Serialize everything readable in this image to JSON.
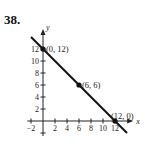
{
  "problem_number": "38.",
  "chart_data": {
    "type": "line",
    "title": "",
    "xlabel": "x",
    "ylabel": "y",
    "x_ticks": [
      -2,
      2,
      4,
      6,
      8,
      10,
      12
    ],
    "y_ticks": [
      2,
      4,
      6,
      8,
      10,
      12
    ],
    "xlim": [
      -2,
      14
    ],
    "ylim": [
      -2,
      14
    ],
    "grid": false,
    "series": [
      {
        "name": "line",
        "x": [
          -2,
          14
        ],
        "y": [
          14,
          -2
        ]
      }
    ],
    "points": [
      {
        "x": 0,
        "y": 12,
        "label": "(0, 12)"
      },
      {
        "x": 6,
        "y": 6,
        "label": "(6, 6)"
      },
      {
        "x": 12,
        "y": 0,
        "label": "(12, 0)"
      }
    ],
    "colors": {
      "line": "#111111",
      "axes": "#222222"
    }
  }
}
